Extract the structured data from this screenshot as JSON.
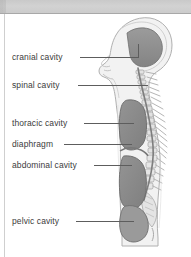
{
  "page": {
    "background_color": "#ffffff",
    "scan_band_color": "#cfcfcf",
    "rule_color": "#a8a8a8"
  },
  "figure": {
    "name": "human-body-cavities-sagittal-diagram",
    "colors": {
      "cavity_fill": "#8a8a8a",
      "cavity_fill_light": "#9a9a9a",
      "body_fill": "#f0f0f0",
      "body_outline": "#b4b4b4",
      "skeleton": "#d8d8d8",
      "skeleton_outline": "#a0a0a0"
    }
  },
  "labels": [
    {
      "id": "cranial",
      "text": "cranial cavity"
    },
    {
      "id": "spinal",
      "text": "spinal cavity"
    },
    {
      "id": "thoracic",
      "text": "thoracic cavity"
    },
    {
      "id": "diaphragm",
      "text": "diaphragm"
    },
    {
      "id": "abdominal",
      "text": "abdominal cavity"
    },
    {
      "id": "pelvic",
      "text": "pelvic cavity"
    }
  ]
}
